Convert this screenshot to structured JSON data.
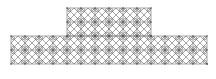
{
  "diagram": {
    "type": "geometric-tiling",
    "stroke_color": "#6b6b6b",
    "background": "#ffffff",
    "cell_size": 14,
    "upper_block": {
      "x": 67,
      "y": 8,
      "cols": 6,
      "rows": 2
    },
    "lower_block": {
      "x": 11,
      "y": 36,
      "cols": 14,
      "rows": 2
    }
  }
}
